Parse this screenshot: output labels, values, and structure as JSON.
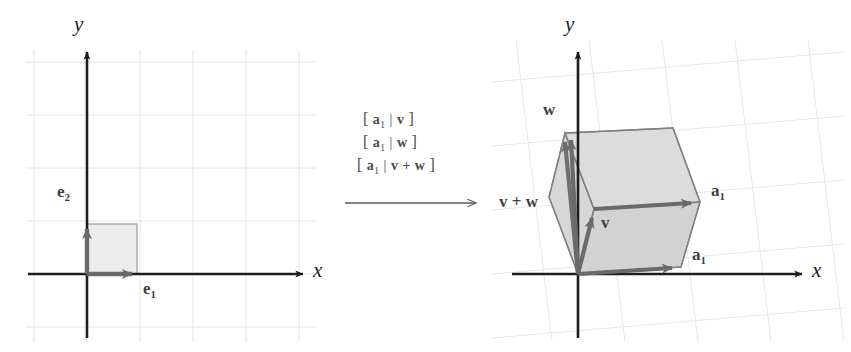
{
  "figure": {
    "type": "linear-transformation-diagram",
    "background": "#ffffff",
    "width": 851,
    "height": 352,
    "colors": {
      "axis": "#1d1d1d",
      "vector": "#6a6a6a",
      "vector_dark": "#5a5a5a",
      "grid": "#e2e2e2",
      "fill": "#d9d9d9",
      "edge": "#8c8c8c",
      "label": "#4a4a4a"
    }
  },
  "left_panel": {
    "name": "domain-plane",
    "x_axis_label": "x",
    "y_axis_label": "y",
    "origin": {
      "x": 87,
      "y": 274
    },
    "grid_spacing": 53,
    "unit_square": {
      "label": "unit-square",
      "corner_x": 137,
      "corner_y": 224,
      "fill": "#ebebeb"
    },
    "vectors": [
      {
        "name": "e1",
        "label": "e",
        "sub": "1",
        "from": [
          87,
          274
        ],
        "to": [
          137,
          274
        ],
        "label_x": 143,
        "label_y": 281
      },
      {
        "name": "e2",
        "label": "e",
        "sub": "2",
        "from": [
          87,
          274
        ],
        "to": [
          87,
          224
        ],
        "label_x": 57,
        "label_y": 183
      }
    ]
  },
  "middle": {
    "name": "transformation-arrow-group",
    "matrix_rows": [
      {
        "id": "row-1",
        "open": "[",
        "first": "a",
        "first_sub": "1",
        "bar": "|",
        "second": "v",
        "close": "]"
      },
      {
        "id": "row-2",
        "open": "[",
        "first": "a",
        "first_sub": "1",
        "bar": "|",
        "second": "w",
        "close": "]"
      },
      {
        "id": "row-3",
        "open": "[",
        "first": "a",
        "first_sub": "1",
        "bar": "|",
        "second": "v + w",
        "close": "]"
      }
    ],
    "arrow": {
      "from": [
        345,
        203
      ],
      "to": [
        481,
        203
      ]
    }
  },
  "right_panel": {
    "name": "image-plane",
    "x_axis_label": "x",
    "y_axis_label": "y",
    "origin": {
      "x": 578,
      "y": 274
    },
    "parallelepiped": {
      "label": "sheared-unit-cell",
      "fill": "#d6d6d6",
      "vertices": {
        "origin": [
          578,
          274
        ],
        "a1_lower": [
          681,
          267
        ],
        "v": [
          594,
          209
        ],
        "v_plus_w_top": [
          565,
          133
        ],
        "a1_upper": [
          700,
          202
        ],
        "top_right": [
          673,
          128
        ]
      }
    },
    "vectors": [
      {
        "name": "a1-lower",
        "label": "a",
        "sub": "1",
        "from": [
          578,
          274
        ],
        "to": [
          681,
          267
        ],
        "label_x": 692,
        "label_y": 253
      },
      {
        "name": "a1-upper",
        "label": "a",
        "sub": "1",
        "from": [
          594,
          209
        ],
        "to": [
          700,
          202
        ],
        "label_x": 711,
        "label_y": 189
      },
      {
        "name": "v",
        "label": "v",
        "sub": "",
        "from": [
          578,
          274
        ],
        "to": [
          594,
          209
        ],
        "label_x": 601,
        "label_y": 213
      },
      {
        "name": "w",
        "label": "w",
        "sub": "",
        "from": [
          578,
          274
        ],
        "to": [
          567,
          131
        ],
        "label_x": 543,
        "label_y": 100
      },
      {
        "name": "v-plus-w",
        "label": "v + w",
        "sub": "",
        "from": [
          578,
          274
        ],
        "to": [
          563,
          135
        ],
        "label_x": 499,
        "label_y": 192
      }
    ]
  }
}
